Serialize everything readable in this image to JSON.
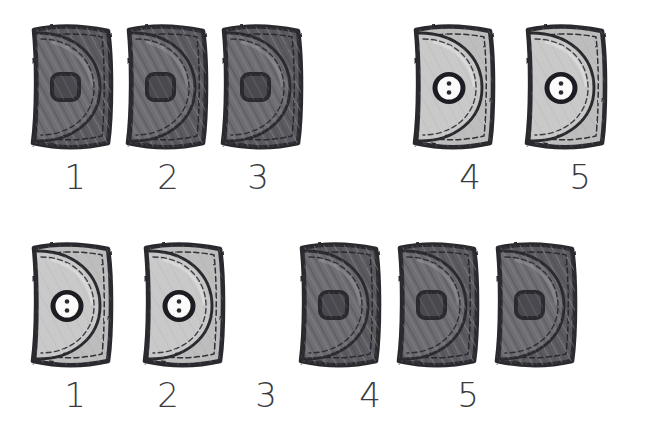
{
  "image": {
    "kind": "hand-drawn-counting-worksheet",
    "background_color": "#ffffff",
    "ink_color": "#3a3a40",
    "object_name": "purse",
    "rows": 2,
    "items_per_row": 5
  },
  "palette": {
    "dark_purse_body": "#5b5b60",
    "dark_purse_flap": "#6e6e73",
    "dark_purse_outline": "#2b2b2f",
    "dark_clasp_fill": "#4a4a50",
    "light_purse_body": "#bdbdbd",
    "light_purse_flap": "#c9c9c9",
    "light_purse_outline": "#2b2b2f",
    "button_white": "#fbfbfb",
    "button_ring": "#1d1d21",
    "stitch_color": "#25252a",
    "numeral_color": "#3a3a40"
  },
  "rows": [
    {
      "row_name": "top-row",
      "items": [
        {
          "index": 1,
          "label": "1",
          "variant": "dark",
          "closure": "square-clasp",
          "x": 22,
          "y": 22,
          "label_x": 45,
          "label_cx": 75
        },
        {
          "index": 2,
          "label": "2",
          "variant": "dark",
          "closure": "square-clasp",
          "x": 117,
          "y": 22,
          "label_x": 138,
          "label_cx": 168
        },
        {
          "index": 3,
          "label": "3",
          "variant": "dark",
          "closure": "square-clasp",
          "x": 212,
          "y": 22,
          "label_x": 228,
          "label_cx": 258
        },
        {
          "index": 4,
          "label": "4",
          "variant": "light",
          "closure": "round-button",
          "x": 404,
          "y": 22,
          "label_x": 440,
          "label_cx": 470
        },
        {
          "index": 5,
          "label": "5",
          "variant": "light",
          "closure": "round-button",
          "x": 516,
          "y": 22,
          "label_x": 550,
          "label_cx": 580
        }
      ]
    },
    {
      "row_name": "bottom-row",
      "items": [
        {
          "index": 1,
          "label": "1",
          "variant": "light",
          "closure": "round-button",
          "x": 22,
          "y": 240,
          "label_x": 45,
          "label_cx": 75
        },
        {
          "index": 2,
          "label": "2",
          "variant": "light",
          "closure": "round-button",
          "x": 134,
          "y": 240,
          "label_x": 138,
          "label_cx": 168
        },
        {
          "index": 3,
          "label": "3",
          "variant": "dark",
          "closure": "square-clasp",
          "x": 290,
          "y": 240,
          "label_x": 236,
          "label_cx": 266
        },
        {
          "index": 4,
          "label": "4",
          "variant": "dark",
          "closure": "square-clasp",
          "x": 388,
          "y": 240,
          "label_x": 340,
          "label_cx": 370
        },
        {
          "index": 5,
          "label": "5",
          "variant": "dark",
          "closure": "square-clasp",
          "x": 486,
          "y": 240,
          "label_x": 438,
          "label_cx": 468
        }
      ]
    }
  ]
}
